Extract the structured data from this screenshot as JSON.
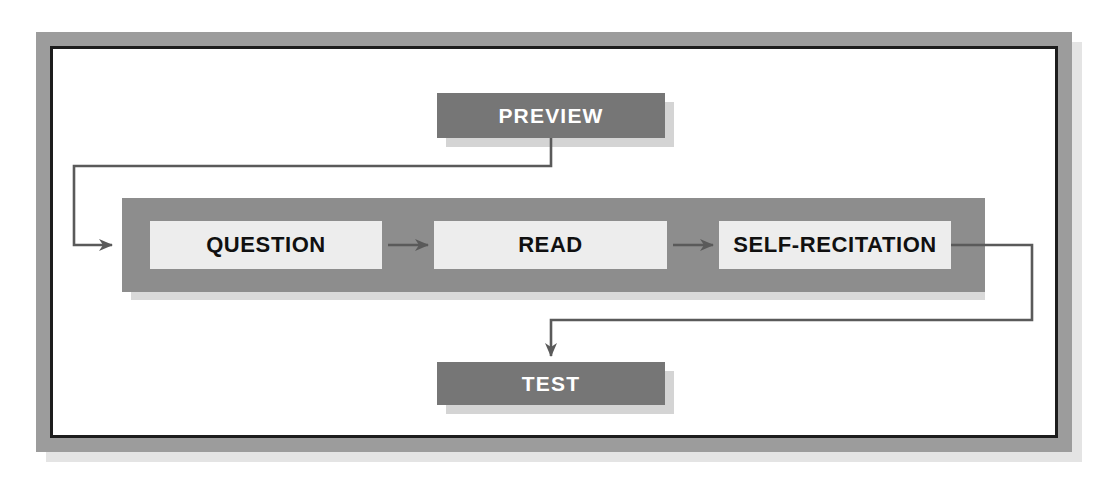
{
  "diagram": {
    "frame": {
      "border_color": "#9c9c9c",
      "inner_line_color": "#1d1d1d",
      "background": "#ffffff"
    },
    "colors": {
      "dark_box": "#767676",
      "dark_box_text": "#ffffff",
      "band": "#8d8d8d",
      "light_box": "#ededed",
      "light_box_text": "#101010",
      "connector": "#5a5a5a",
      "shadow": "#d4d4d4"
    },
    "nodes": {
      "preview": {
        "label": "PREVIEW",
        "style": "dark"
      },
      "question": {
        "label": "QUESTION",
        "style": "light"
      },
      "read": {
        "label": "READ",
        "style": "light"
      },
      "self_recitation": {
        "label": "SELF-RECITATION",
        "style": "light"
      },
      "test": {
        "label": "TEST",
        "style": "dark"
      }
    },
    "connectors": [
      {
        "name": "preview-to-loop",
        "from": "preview",
        "to": "question",
        "kind": "elbow-left"
      },
      {
        "name": "question-to-read",
        "from": "question",
        "to": "read",
        "kind": "straight-arrow"
      },
      {
        "name": "read-to-self-recitation",
        "from": "read",
        "to": "self_recitation",
        "kind": "straight-arrow"
      },
      {
        "name": "self-recitation-to-test",
        "from": "self_recitation",
        "to": "test",
        "kind": "elbow-right"
      }
    ]
  }
}
